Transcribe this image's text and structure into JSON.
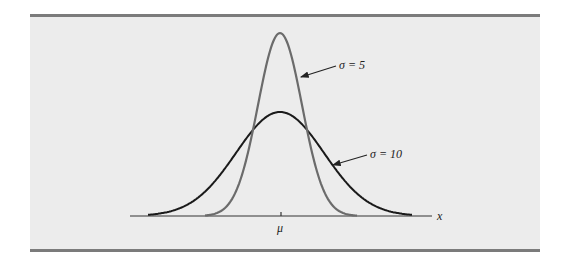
{
  "chart_data": {
    "type": "line",
    "title": "",
    "xlabel": "x",
    "ylabel": "",
    "x_tick_labels": [
      "μ"
    ],
    "grid": false,
    "legend": "annotations",
    "series": [
      {
        "name": "σ = 5",
        "mean": "μ",
        "sd": 5,
        "color": "#6b6b6b",
        "peak_relative": 1.0
      },
      {
        "name": "σ = 10",
        "mean": "μ",
        "sd": 10,
        "color": "#1a1a1a",
        "peak_relative": 0.5
      }
    ],
    "annotations": [
      {
        "text": "σ = 5",
        "points_to": "σ = 5 curve"
      },
      {
        "text": "σ = 10",
        "points_to": "σ = 10 curve"
      }
    ]
  },
  "labels": {
    "sigma5": "σ = 5",
    "sigma10": "σ = 10",
    "mu": "μ",
    "x": "x"
  },
  "colors": {
    "panel": "#ececec",
    "rule": "#7b7b7b",
    "sigma5_curve": "#6b6b6b",
    "sigma10_curve": "#1a1a1a",
    "axis": "#333333"
  }
}
